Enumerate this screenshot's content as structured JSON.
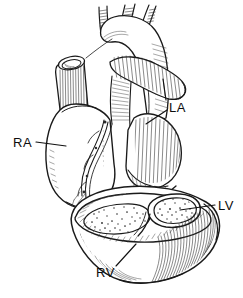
{
  "figure": {
    "style": "pen-and-ink line engraving, black on white",
    "background_color": "#ffffff",
    "ink_color": "#1a1a1a",
    "width": 243,
    "height": 298
  },
  "labels": [
    {
      "id": "ra",
      "text": "RA",
      "meaning": "right atrium",
      "x": 13,
      "y": 136,
      "leader": "horizontal line extending right from label to the right atrial wall"
    },
    {
      "id": "la",
      "text": "LA",
      "meaning": "left atrium",
      "x": 169,
      "y": 101,
      "leader": "vertical line down from pulmonary artery plus short diagonal line down-left to the left atrium"
    },
    {
      "id": "lv",
      "text": "LV",
      "meaning": "left ventricle",
      "x": 218,
      "y": 199,
      "leader": "horizontal line extending left from label to the thick left ventricular wall"
    },
    {
      "id": "rv",
      "text": "RV",
      "meaning": "right ventricle",
      "x": 96,
      "y": 266,
      "leader": "diagonal line extending up-right from label into the right ventricular cavity"
    }
  ],
  "structures": [
    {
      "name": "aortic-arch",
      "description": "ascending aorta curving over the top with three branch vessels cut short"
    },
    {
      "name": "brachiocephalic-branches",
      "description": "three short cut vessel stubs rising from the aortic arch"
    },
    {
      "name": "superior-vena-cava",
      "description": "cut tubular vessel at upper left with an open elliptical lumen"
    },
    {
      "name": "pulmonary-artery",
      "description": "hatched tube crossing to the right from the arch region"
    },
    {
      "name": "right-atrium",
      "description": "large smooth chamber on the left side of the drawing"
    },
    {
      "name": "left-atrium",
      "description": "hatched chamber on the right behind the pulmonary artery"
    },
    {
      "name": "coronary-groove",
      "description": "paired wavy vessel lines descending across the heart surface"
    },
    {
      "name": "ventricular-cross-section",
      "description": "detached cone-shaped block showing both ventricular cavities in cut view"
    },
    {
      "name": "left-ventricle-cavity",
      "description": "small round cavity with thick surrounding muscular wall"
    },
    {
      "name": "right-ventricle-cavity",
      "description": "larger crescent cavity with thin wall"
    },
    {
      "name": "myocardium-texture",
      "description": "dense parallel hatching indicating cut muscle"
    },
    {
      "name": "endocardium-stipple",
      "description": "stippled dots lining the inner cavity surfaces"
    }
  ]
}
